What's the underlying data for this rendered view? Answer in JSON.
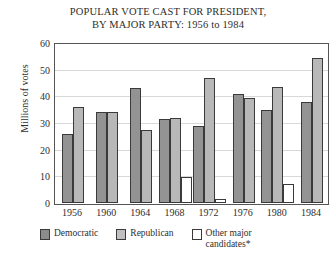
{
  "chart_data": {
    "type": "bar",
    "title": "POPULAR VOTE CAST FOR PRESIDENT, BY MAJOR PARTY: 1956 to 1984",
    "title_lines": [
      "POPULAR VOTE CAST FOR PRESIDENT,",
      "BY MAJOR PARTY: 1956 to 1984"
    ],
    "xlabel": "",
    "ylabel": "Millions of votes",
    "ylim": [
      0,
      60
    ],
    "ytick_labels": [
      "0",
      "10",
      "20",
      "30",
      "40",
      "50",
      "60"
    ],
    "ytick_values": [
      0,
      10,
      20,
      30,
      40,
      50,
      60
    ],
    "grid": true,
    "grid_axis": "y",
    "legend_position": "bottom",
    "categories": [
      "1956",
      "1960",
      "1964",
      "1968",
      "1972",
      "1976",
      "1980",
      "1984"
    ],
    "series": [
      {
        "name": "Democratic",
        "color": "#939393",
        "values": [
          26,
          34,
          43,
          31.5,
          29,
          41,
          35,
          38
        ]
      },
      {
        "name": "Republican",
        "color": "#b8b8b8",
        "values": [
          36,
          34,
          27.5,
          32,
          47,
          39.5,
          43.5,
          54.5
        ]
      },
      {
        "name": "Other major candidates*",
        "color": "#ffffff",
        "values": [
          null,
          null,
          null,
          9.9,
          1.5,
          null,
          7,
          null
        ]
      }
    ]
  },
  "legend": {
    "items": [
      {
        "label": "Democratic",
        "swatch": "democratic"
      },
      {
        "label": "Republican",
        "swatch": "republican"
      },
      {
        "label": "Other major candidates*",
        "swatch": "other"
      }
    ]
  }
}
